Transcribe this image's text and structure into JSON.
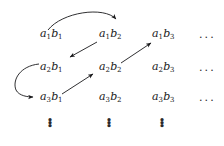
{
  "figure": {
    "type": "countability-enumeration-grid",
    "ink_color": "#19191b",
    "background_color": "#ffffff"
  },
  "grid": {
    "row_labels": [
      "a1",
      "a2",
      "a3"
    ],
    "column_labels": [
      "b1",
      "b2",
      "b3"
    ],
    "rows": [
      {
        "cells": [
          {
            "base1": "a",
            "sub1": "1",
            "base2": "b",
            "sub2": "1"
          },
          {
            "base1": "a",
            "sub1": "1",
            "base2": "b",
            "sub2": "2"
          },
          {
            "base1": "a",
            "sub1": "1",
            "base2": "b",
            "sub2": "3"
          }
        ],
        "trailing": "..."
      },
      {
        "cells": [
          {
            "base1": "a",
            "sub1": "2",
            "base2": "b",
            "sub2": "1"
          },
          {
            "base1": "a",
            "sub1": "2",
            "base2": "b",
            "sub2": "2"
          },
          {
            "base1": "a",
            "sub1": "2",
            "base2": "b",
            "sub2": "3"
          }
        ],
        "trailing": "..."
      },
      {
        "cells": [
          {
            "base1": "a",
            "sub1": "3",
            "base2": "b",
            "sub2": "1"
          },
          {
            "base1": "a",
            "sub1": "3",
            "base2": "b",
            "sub2": "2"
          },
          {
            "base1": "a",
            "sub1": "3",
            "base2": "b",
            "sub2": "3"
          }
        ],
        "trailing": "..."
      }
    ],
    "column_continuation": [
      "⋮",
      "⋮",
      "⋮"
    ]
  },
  "path": {
    "name": "zigzag-enumeration-path",
    "steps": [
      {
        "id": "arc-top",
        "from": "a1b1",
        "to": "a1b2",
        "shape": "curved-arc-over"
      },
      {
        "id": "diag-down-left-1",
        "from": "a1b2",
        "to": "a2b1",
        "shape": "straight-diagonal"
      },
      {
        "id": "arc-left",
        "from": "a2b1",
        "to": "a3b1",
        "shape": "curved-arc-left"
      },
      {
        "id": "diag-up-right-1",
        "from": "a3b1",
        "to": "a2b2",
        "shape": "straight-diagonal"
      },
      {
        "id": "diag-up-right-2",
        "from": "a2b2",
        "to": "a1b3",
        "shape": "straight-diagonal"
      }
    ]
  }
}
